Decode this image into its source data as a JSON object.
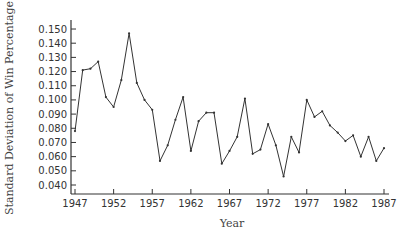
{
  "chart_data": {
    "type": "line",
    "title": "",
    "xlabel": "Year",
    "ylabel": "Standard Deviation of Win Percentage",
    "xlim": [
      1947,
      1987
    ],
    "ylim": [
      0.035,
      0.155
    ],
    "grid": false,
    "legend": null,
    "x_ticks": [
      "1947",
      "1952",
      "1957",
      "1962",
      "1967",
      "1972",
      "1977",
      "1982",
      "1987"
    ],
    "y_ticks": [
      "0.040",
      "0.050",
      "0.060",
      "0.070",
      "0.080",
      "0.090",
      "0.100",
      "0.110",
      "0.120",
      "0.130",
      "0.140",
      "0.150"
    ],
    "x": [
      1947,
      1948,
      1949,
      1950,
      1951,
      1952,
      1953,
      1954,
      1955,
      1956,
      1957,
      1958,
      1959,
      1960,
      1961,
      1962,
      1963,
      1964,
      1965,
      1966,
      1967,
      1968,
      1969,
      1970,
      1971,
      1972,
      1973,
      1974,
      1975,
      1976,
      1977,
      1978,
      1979,
      1980,
      1981,
      1982,
      1983,
      1984,
      1985,
      1986,
      1987
    ],
    "series": [
      {
        "name": "Standard Deviation of Win Percentage",
        "color": "#333333",
        "values": [
          0.078,
          0.121,
          0.122,
          0.127,
          0.102,
          0.095,
          0.114,
          0.147,
          0.112,
          0.1,
          0.093,
          0.057,
          0.068,
          0.086,
          0.102,
          0.064,
          0.085,
          0.091,
          0.091,
          0.055,
          0.064,
          0.074,
          0.101,
          0.062,
          0.065,
          0.083,
          0.068,
          0.046,
          0.074,
          0.063,
          0.1,
          0.088,
          0.092,
          0.082,
          0.077,
          0.071,
          0.075,
          0.06,
          0.074,
          0.057,
          0.066
        ]
      }
    ]
  }
}
